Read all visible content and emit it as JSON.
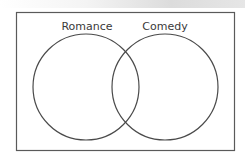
{
  "diagram": {
    "type": "venn",
    "sets": [
      {
        "label": "Romance"
      },
      {
        "label": "Comedy"
      }
    ],
    "colors": {
      "stroke": "#4a4a4a",
      "text": "#3a3a3a",
      "background": "#ffffff"
    }
  }
}
